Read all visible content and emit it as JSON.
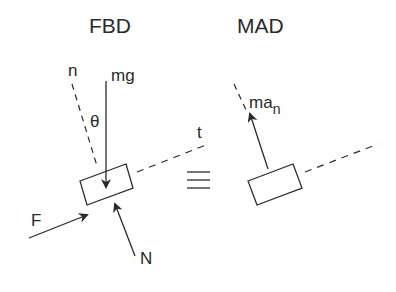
{
  "fbd": {
    "title": "FBD",
    "labels": {
      "n": "n",
      "mg": "mg",
      "theta": "θ",
      "t": "t",
      "F": "F",
      "N": "N"
    }
  },
  "equivalence": {
    "symbol": "≡"
  },
  "mad": {
    "title": "MAD",
    "labels": {
      "ma": "ma",
      "ma_sub": "n"
    }
  },
  "colors": {
    "ink": "#2a2a2a",
    "background": "#ffffff"
  }
}
